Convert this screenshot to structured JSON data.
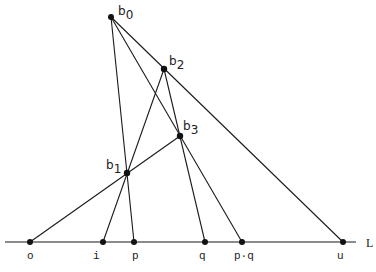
{
  "diagram": {
    "type": "projective-construction",
    "line_label": "L",
    "points": {
      "b0": {
        "label": "b",
        "sub": "0",
        "x": 111,
        "y": 17
      },
      "b1": {
        "label": "b",
        "sub": "1",
        "x": 127,
        "y": 173
      },
      "b2": {
        "label": "b",
        "sub": "2",
        "x": 164,
        "y": 69
      },
      "b3": {
        "label": "b",
        "sub": "3",
        "x": 180,
        "y": 136
      },
      "o": {
        "label": "o",
        "x": 30,
        "y": 242
      },
      "i": {
        "label": "i",
        "x": 103,
        "y": 242
      },
      "p": {
        "label": "p",
        "x": 134,
        "y": 242
      },
      "q": {
        "label": "q",
        "x": 205,
        "y": 242
      },
      "pq": {
        "label": "p·q",
        "x": 242,
        "y": 242
      },
      "u": {
        "label": "u",
        "x": 343,
        "y": 242
      }
    },
    "segments": [
      [
        "b0",
        "p"
      ],
      [
        "b0",
        "u"
      ],
      [
        "b0",
        "pq"
      ],
      [
        "b2",
        "i"
      ],
      [
        "b2",
        "q"
      ],
      [
        "o",
        "b3"
      ]
    ]
  }
}
